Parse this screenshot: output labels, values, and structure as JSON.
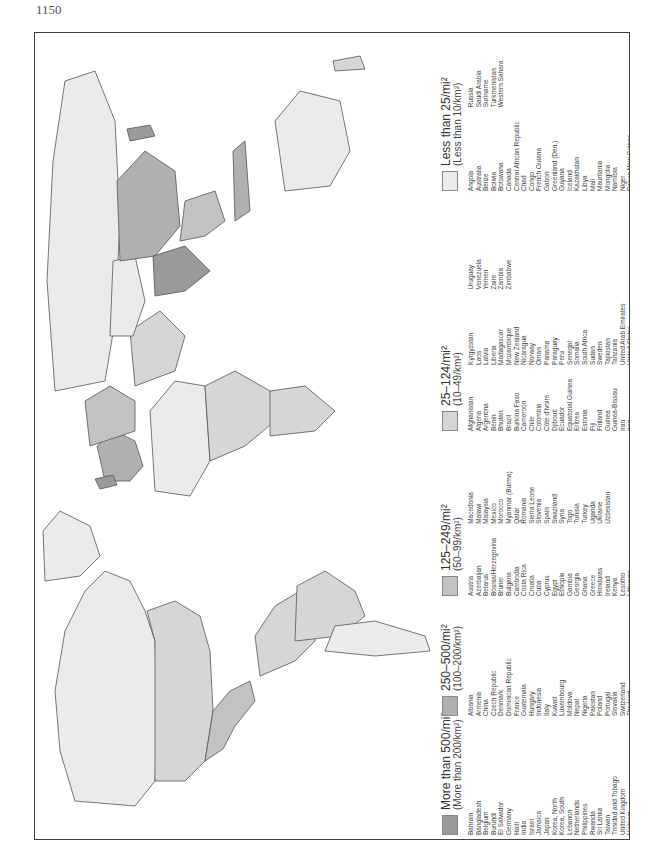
{
  "page": {
    "number": "1150"
  },
  "colors": {
    "d500": "#9a9a9a",
    "d250": "#b0b0b0",
    "d125": "#c2c2c2",
    "d25": "#d6d6d6",
    "d0": "#ebebeb",
    "border": "#444444"
  },
  "legend": {
    "categories": [
      {
        "title": "More than 500/mi²",
        "sub": "(More than 200/km²)",
        "color": "#9a9a9a",
        "columns": [
          [
            "Bahrain",
            "Bangladesh",
            "Belgium",
            "Burundi",
            "El Salvador",
            "Germany",
            "Haiti",
            "India",
            "Israel",
            "Jamaica",
            "Japan",
            "Korea, North",
            "Korea, South",
            "Lebanon",
            "Netherlands",
            "Philippines",
            "Rwanda",
            "Sri Lanka",
            "Taiwan",
            "Trinidad and Tobago",
            "United Kingdom",
            "Vietnam"
          ]
        ]
      },
      {
        "title": "250–500/mi²",
        "sub": "(100–200/km²)",
        "color": "#b0b0b0",
        "columns": [
          [
            "Albania",
            "Armenia",
            "China",
            "Czech Republic",
            "Denmark",
            "Dominican Republic",
            "France",
            "Guatemala",
            "Hungary",
            "Indonesia",
            "Italy",
            "Kuwait",
            "Luxembourg",
            "Moldova",
            "Nepal",
            "Nigeria",
            "Pakistan",
            "Poland",
            "Portugal",
            "Slovakia",
            "Switzerland",
            "Thailand",
            "Yugoslavia"
          ]
        ]
      },
      {
        "title": "125–249/mi²",
        "sub": "(50–99/km²)",
        "color": "#c2c2c2",
        "columns": [
          [
            "Austria",
            "Azerbaijan",
            "Belarus",
            "Bosnia/Herzegovina",
            "Brunei",
            "Bulgaria",
            "Cambodia",
            "Costa Rica",
            "Croatia",
            "Cuba",
            "Cyprus",
            "Egypt",
            "Ethiopia",
            "Gambia",
            "Georgia",
            "Ghana",
            "Greece",
            "Honduras",
            "Ireland",
            "Kenya",
            "Lesotho",
            "Lithuania"
          ],
          [
            "Macedonia",
            "Malawi",
            "Malaysia",
            "Mexico",
            "Morocco",
            "Myanmar (Burma)",
            "Qatar",
            "Romania",
            "Sierra Leone",
            "Slovenia",
            "Spain",
            "Swaziland",
            "Syria",
            "Togo",
            "Tunisia",
            "Turkey",
            "Uganda",
            "Ukraine",
            "Uzbekistan"
          ]
        ]
      },
      {
        "title": "25–124/mi²",
        "sub": "(10–49/km²)",
        "color": "#d6d6d6",
        "columns": [
          [
            "Afghanistan",
            "Algeria",
            "Argentina",
            "Benin",
            "Bhutan",
            "Brazil",
            "Burkina Faso",
            "Cameroon",
            "Chile",
            "Colombia",
            "Côte d'Ivoire",
            "Djibouti",
            "Ecuador",
            "Equatorial Guinea",
            "Eritrea",
            "Estonia",
            "Fiji",
            "Finland",
            "Guinea",
            "Guinea-Bissau",
            "Iran",
            "Iraq",
            "Jordan"
          ],
          [
            "Kyrgyzstan",
            "Laos",
            "Latvia",
            "Liberia",
            "Madagascar",
            "Mozambique",
            "New Zealand",
            "Nicaragua",
            "Norway",
            "Oman",
            "Panama",
            "Paraguay",
            "Peru",
            "Senegal",
            "Somalia",
            "South Africa",
            "Sudan",
            "Sweden",
            "Tajikistan",
            "Tanzania",
            "United Arab Emirates",
            "United States"
          ],
          [
            "Uruguay",
            "Venezuela",
            "Yemen",
            "Zaire",
            "Zambia",
            "Zimbabwe"
          ]
        ]
      },
      {
        "title": "Less than 25/mi²",
        "sub": "(Less than 10/km²)",
        "color": "#ebebeb",
        "columns": [
          [
            "Angola",
            "Australia",
            "Belize",
            "Bolivia",
            "Botswana",
            "Canada",
            "Central African Republic",
            "Chad",
            "Congo",
            "French Guiana",
            "Gabon",
            "Greenland (Den.)",
            "Guyana",
            "Iceland",
            "Kazakhstan",
            "Libya",
            "Mali",
            "Mauritania",
            "Mongolia",
            "Namibia",
            "Niger",
            "Papua New Guinea"
          ],
          [
            "Russia",
            "Saudi Arabia",
            "Suriname",
            "Turkmenistan",
            "Western Sahara"
          ]
        ]
      }
    ]
  }
}
